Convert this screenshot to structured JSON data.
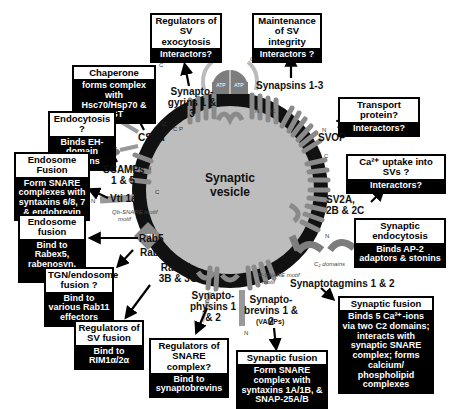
{
  "vesicle": {
    "label_line1": "Synaptic",
    "label_line2": "vesicle"
  },
  "boxes": [
    {
      "id": "regulators-exocytosis",
      "header": "Regulators of SV exocytosis",
      "body": "Interactors?"
    },
    {
      "id": "maintenance-integrity",
      "header": "Maintenance of SV integrity",
      "body": "Interactors ?"
    },
    {
      "id": "chaperone",
      "header": "Chaperone",
      "body": "forms complex with Hsc70/Hsp70 & SGT"
    },
    {
      "id": "transport-protein",
      "header": "Transport protein?",
      "body": "Interactors?"
    },
    {
      "id": "endocytosis",
      "header": "Endocytosis ?",
      "body": "Binds EH-domain proteins"
    },
    {
      "id": "endosome-fusion-1",
      "header": "Endosome Fusion",
      "body": "Form SNARE complexes with syntaxins 6/8, 7 & endobrevin"
    },
    {
      "id": "ca-uptake",
      "header": "Ca²⁺ uptake into SVs ?",
      "body": "Interactors?"
    },
    {
      "id": "endosome-fusion-2",
      "header": "Endosome fusion",
      "body": "Bind to Rabex5, rabenosyn, etc."
    },
    {
      "id": "synaptic-endocytosis",
      "header": "Synaptic endocytosis",
      "body": "Binds AP-2 adaptors & stonins"
    },
    {
      "id": "tgn-endosome",
      "header": "TGN/endosome fusion ?",
      "body": "Bind to various Rab11 effectors"
    },
    {
      "id": "synaptic-fusion-syt",
      "header": "Synaptic fusion",
      "body": "Binds 5 Ca²⁺-ions via two C2 domains; interacts with synaptic SNARE complex; forms calcium/ phospholipid complexes"
    },
    {
      "id": "regulators-sv-fusion",
      "header": "Regulators of SV fusion",
      "body": "Bind to RIM1α/2α"
    },
    {
      "id": "regulators-snare",
      "header": "Regulators of SNARE complex?",
      "body": "Bind to synaptobrevins"
    },
    {
      "id": "synaptic-fusion-vamp",
      "header": "Synaptic fusion",
      "body": "Form SNARE complex with syntaxins 1A/1B, & SNAP-25A/B"
    }
  ],
  "proteins": {
    "synaptogyrins": "Synapto- gyrins 1 & 3",
    "synapsins": "Synapsins 1-3",
    "csp": "CSPα",
    "svop": "SVOP",
    "scamps": "SCAMPs 1 & 5",
    "vti1a": "Vti 1aβ",
    "sv2": "SV2A, 2B & 2C",
    "rab5": "Rab5",
    "rab11": "Rab11",
    "rab3": "Rab3A, 3B & 3C",
    "synaptotagmins": "Synaptotagmins 1 & 2",
    "synaptophysins": "Synapto- physins 1 & 2",
    "synaptobrevins": "Synapto- brevins 1 & 2",
    "vamps": "(VAMPs)"
  },
  "annotations": {
    "atp": "ATP",
    "gtp": "GTP",
    "dnaj": "DNA-J",
    "qb_snare": "Qb-SNARE motif",
    "r_snare": "R-SNARE motif",
    "c2_domains": "C₂ domains",
    "ppp": "PPP",
    "ca": "2Ca²⁺"
  },
  "colors": {
    "membrane": "#111111",
    "lumen": "#bdbdbd",
    "protein": "#8a8a8a",
    "box_bg": "#000000",
    "box_header": "#ffffff"
  }
}
